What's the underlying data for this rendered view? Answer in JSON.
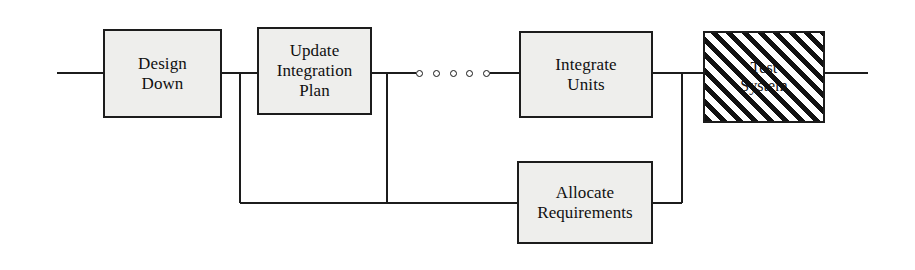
{
  "diagram": {
    "canvas": {
      "width": 915,
      "height": 270,
      "background": "#ffffff"
    },
    "style": {
      "box_fill": "#eeeeec",
      "box_stroke": "#1c1c1c",
      "line_color": "#1c1c1c",
      "hatch_color": "#111111",
      "text_color": "#101010"
    },
    "nodes": [
      {
        "id": "design-down",
        "label": "Design\nDown",
        "line1": "Design",
        "line2": "Down",
        "fill": "solid",
        "x": 103,
        "y": 29,
        "width": 119,
        "height": 89
      },
      {
        "id": "update-integration-plan",
        "label": "Update\nIntegration\nPlan",
        "line1": "Update",
        "line2": "Integration",
        "line3": "Plan",
        "fill": "solid",
        "x": 257,
        "y": 27,
        "width": 115,
        "height": 88
      },
      {
        "id": "integrate-units",
        "label": "Integrate\nUnits",
        "line1": "Integrate",
        "line2": "Units",
        "fill": "solid",
        "x": 519,
        "y": 31,
        "width": 134,
        "height": 87
      },
      {
        "id": "test-system",
        "label": "Test\nSystem",
        "line1": "Test",
        "line2": "System",
        "fill": "hatched",
        "x": 703,
        "y": 31,
        "width": 122,
        "height": 92
      },
      {
        "id": "allocate-requirements",
        "label": "Allocate\nRequirements",
        "line1": "Allocate",
        "line2": "Requirements",
        "fill": "solid",
        "x": 517,
        "y": 161,
        "width": 136,
        "height": 83
      }
    ],
    "ellipsis": {
      "id": "process-ellipsis",
      "dot_count": 5,
      "x": 416,
      "y": 70,
      "width": 74
    },
    "connectors": [
      {
        "id": "entry-line",
        "type": "horizontal",
        "from_x": 57,
        "to_x": 103,
        "y": 73
      },
      {
        "id": "design-down-to-update",
        "type": "horizontal",
        "from_x": 222,
        "to_x": 257,
        "y": 73
      },
      {
        "id": "update-to-ellipsis",
        "type": "horizontal",
        "from_x": 372,
        "to_x": 416,
        "y": 73
      },
      {
        "id": "ellipsis-to-integrate",
        "type": "horizontal",
        "from_x": 490,
        "to_x": 519,
        "y": 73
      },
      {
        "id": "integrate-to-test",
        "type": "horizontal",
        "from_x": 653,
        "to_x": 703,
        "y": 73
      },
      {
        "id": "exit-line",
        "type": "horizontal",
        "from_x": 825,
        "to_x": 868,
        "y": 73
      },
      {
        "id": "feedback-drop-left",
        "type": "vertical",
        "x": 240,
        "from_y": 73,
        "to_y": 203
      },
      {
        "id": "feedback-drop-mid",
        "type": "vertical",
        "x": 387,
        "from_y": 73,
        "to_y": 203
      },
      {
        "id": "feedback-drop-right",
        "type": "vertical",
        "x": 682,
        "from_y": 73,
        "to_y": 203
      },
      {
        "id": "feedback-return-line",
        "type": "horizontal",
        "from_x": 240,
        "to_x": 517,
        "y": 203
      },
      {
        "id": "allocate-to-drop-right",
        "type": "horizontal",
        "from_x": 653,
        "to_x": 682,
        "y": 203
      }
    ]
  }
}
